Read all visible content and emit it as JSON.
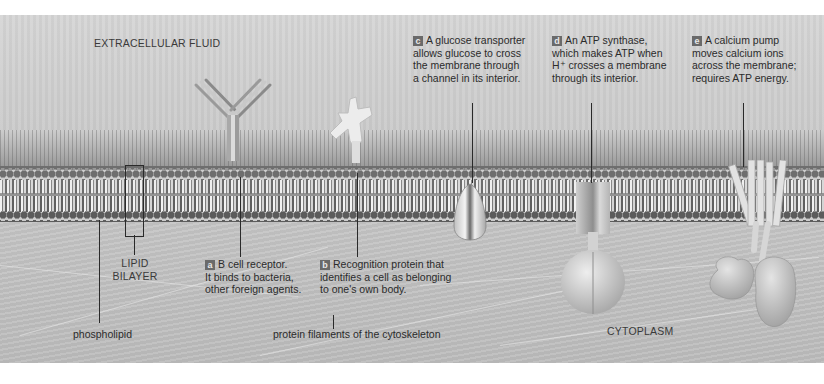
{
  "regions": {
    "extracellular": "EXTRACELLULAR FLUID",
    "cytoplasm": "CYTOPLASM"
  },
  "labels": {
    "lipid_bilayer": [
      "LIPID",
      "BILAYER"
    ],
    "phospholipid": "phospholipid",
    "cytoskeleton": "protein filaments of the cytoskeleton"
  },
  "callouts": [
    {
      "id": "a",
      "badge": "a",
      "lines": [
        "B cell receptor.",
        "It binds to bacteria,",
        "other foreign agents."
      ]
    },
    {
      "id": "b",
      "badge": "b",
      "lines": [
        "Recognition protein that",
        "identifies a cell as belonging",
        "to one's own body."
      ]
    },
    {
      "id": "c",
      "badge": "c",
      "lines": [
        "A glucose transporter",
        "allows glucose to cross",
        "the membrane through",
        "a channel in its interior."
      ]
    },
    {
      "id": "d",
      "badge": "d",
      "lines": [
        "An ATP synthase,",
        "which makes ATP when",
        "H⁺ crosses a membrane",
        "through its interior."
      ]
    },
    {
      "id": "e",
      "badge": "e",
      "lines": [
        "A calcium pump",
        "moves calcium ions",
        "across the membrane;",
        "requires ATP energy."
      ]
    }
  ],
  "colors": {
    "badge_bg": "#6a6a6a",
    "text": "#2b2b2b",
    "background": "#cfcfcf"
  }
}
